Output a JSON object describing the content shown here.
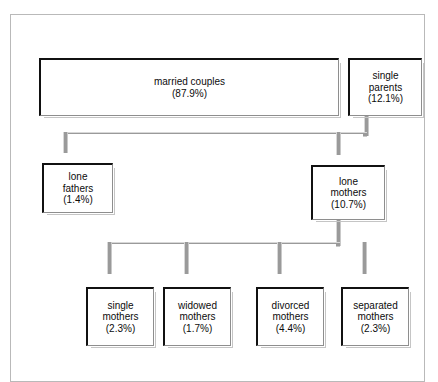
{
  "diagram": {
    "type": "tree",
    "frame": {
      "border_color": "#b9b9b9"
    },
    "connector_color": "#9a9a9a",
    "box_border_color": "#111111",
    "nodes": [
      {
        "id": "married-couples",
        "label": "married couples",
        "percent": "(87.9%)",
        "value": 87.9,
        "level": 1
      },
      {
        "id": "single-parents",
        "label_line1": "single",
        "label_line2": "parents",
        "percent": "(12.1%)",
        "value": 12.1,
        "level": 1
      },
      {
        "id": "lone-fathers",
        "label_line1": "lone",
        "label_line2": "fathers",
        "percent": "(1.4%)",
        "value": 1.4,
        "level": 2,
        "parent": "single-parents"
      },
      {
        "id": "lone-mothers",
        "label_line1": "lone",
        "label_line2": "mothers",
        "percent": "(10.7%)",
        "value": 10.7,
        "level": 2,
        "parent": "single-parents"
      },
      {
        "id": "single-mothers",
        "label_line1": "single",
        "label_line2": "mothers",
        "percent": "(2.3%)",
        "value": 2.3,
        "level": 3,
        "parent": "lone-mothers"
      },
      {
        "id": "widowed-mothers",
        "label_line1": "widowed",
        "label_line2": "mothers",
        "percent": "(1.7%)",
        "value": 1.7,
        "level": 3,
        "parent": "lone-mothers"
      },
      {
        "id": "divorced-mothers",
        "label_line1": "divorced",
        "label_line2": "mothers",
        "percent": "(4.4%)",
        "value": 4.4,
        "level": 3,
        "parent": "lone-mothers"
      },
      {
        "id": "separated-mothers",
        "label_line1": "separated",
        "label_line2": "mothers",
        "percent": "(2.3%)",
        "value": 2.3,
        "level": 3,
        "parent": "lone-mothers"
      }
    ]
  }
}
